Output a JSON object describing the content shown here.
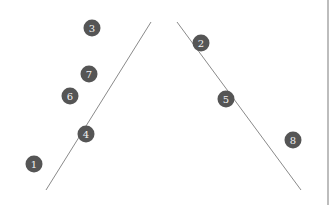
{
  "diagram": {
    "lines": [
      {
        "name": "left-diagonal-line",
        "x1": 151,
        "y1": 22,
        "x2": 46,
        "y2": 190,
        "color": "#8a8a8a"
      },
      {
        "name": "right-diagonal-line",
        "x1": 177,
        "y1": 22,
        "x2": 301,
        "y2": 190,
        "color": "#8a8a8a"
      }
    ],
    "markers": [
      {
        "label": "1",
        "x": 34,
        "y": 164
      },
      {
        "label": "2",
        "x": 201,
        "y": 43
      },
      {
        "label": "3",
        "x": 92,
        "y": 28
      },
      {
        "label": "4",
        "x": 86,
        "y": 134
      },
      {
        "label": "5",
        "x": 226,
        "y": 99
      },
      {
        "label": "6",
        "x": 70,
        "y": 96
      },
      {
        "label": "7",
        "x": 89,
        "y": 74
      },
      {
        "label": "8",
        "x": 293,
        "y": 140
      }
    ],
    "marker_color": "#555555",
    "edge_rule_color": "#bdbdbd"
  }
}
